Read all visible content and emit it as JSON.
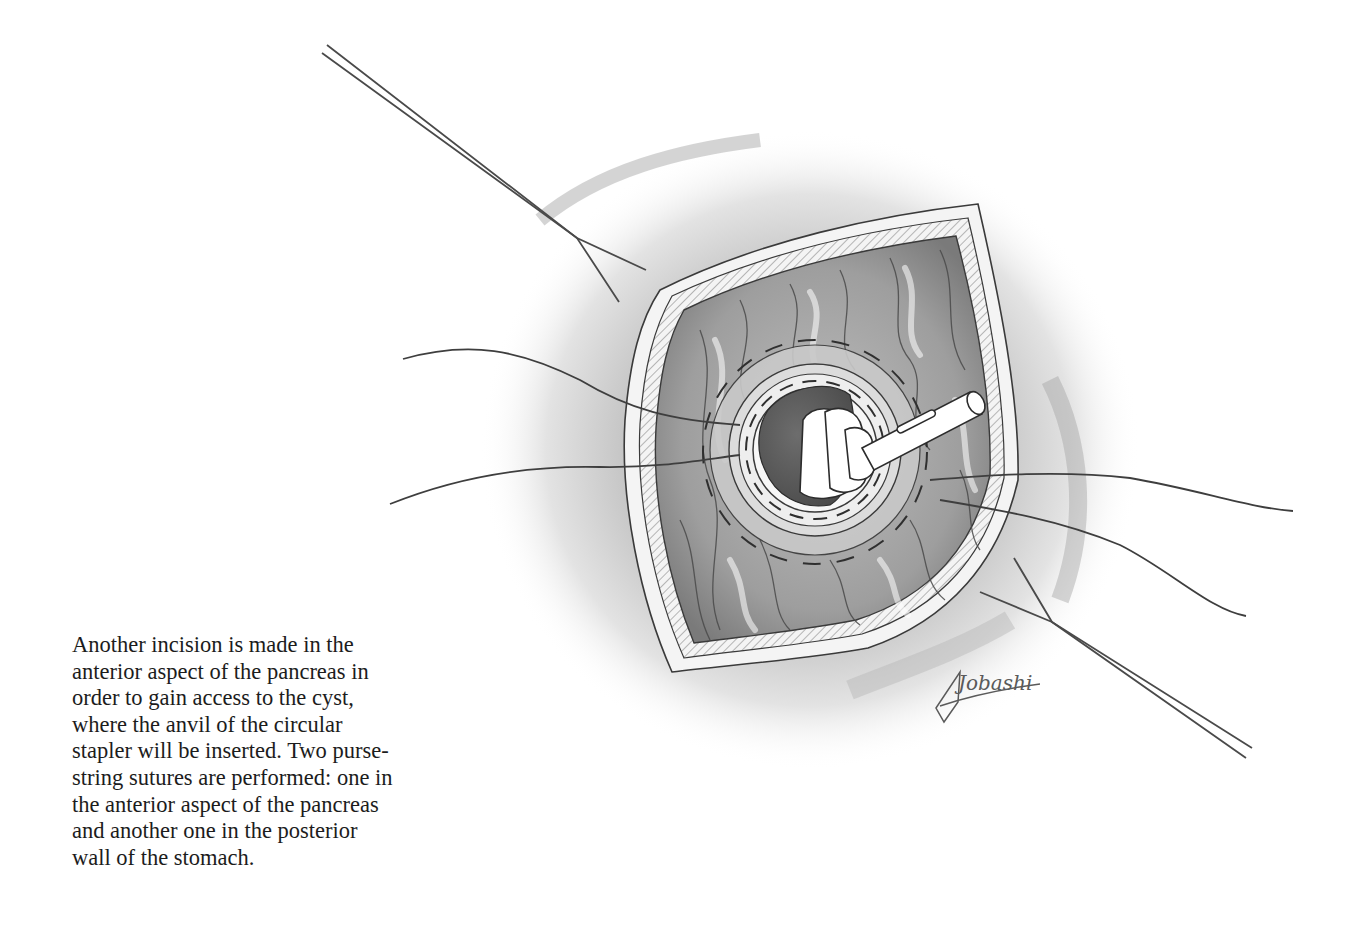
{
  "figure": {
    "caption_lines": [
      "Another incision is made in the",
      "anterior aspect of the pancreas in",
      "order to gain access to the cyst,",
      "where the anvil of the circular",
      "stapler will be inserted. Two purse-",
      "string sutures are performed: one in",
      "the anterior aspect of the pancreas",
      "and another one in the posterior",
      "wall of the stomach."
    ],
    "illustration": {
      "subject": "surgical-illustration-cystogastrostomy-circular-stapler-anvil",
      "artist_signature": "Jobashi"
    },
    "colors": {
      "ink": "#3a3a3a",
      "tissue_shade": "#8c8c8c",
      "background": "#ffffff",
      "text": "#1c1c1c"
    }
  }
}
